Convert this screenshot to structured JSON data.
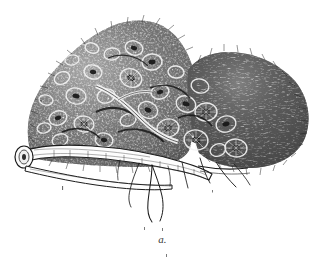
{
  "plate": {
    "kind": "engraving-illustration",
    "subject": "branch encrusted with a dense colony of barnacles",
    "caption": "a.",
    "background_color": "#ffffff",
    "ink_color": "#1e1e1e",
    "midtone_color": "#555555",
    "highlight_color": "#f4f4f4",
    "canvas": {
      "width": 325,
      "height": 271
    }
  },
  "regions": [
    {
      "name": "encrusting-colony-mass",
      "description": "large irregular dome of clustered shells and bristly growth occupying the upper two thirds of the plate",
      "bounds": {
        "x": 25,
        "y": 18,
        "width": 285,
        "height": 150
      },
      "tone": "dark stipple with light shell rings"
    },
    {
      "name": "left-lobe-shell-cluster",
      "description": "left peak of the colony, individual ringed barnacle shells clearly drawn",
      "bounds": {
        "x": 28,
        "y": 22,
        "width": 140,
        "height": 130
      },
      "tone": "mottled mid-grey"
    },
    {
      "name": "right-lobe-bristle-mass",
      "description": "rounded right lobe rendered as uniform dense bristly hatching",
      "bounds": {
        "x": 185,
        "y": 52,
        "width": 125,
        "height": 110
      },
      "tone": "dark uniform hatching"
    },
    {
      "name": "supporting-branch",
      "description": "pale woody stem running left to right beneath the colony, with a blunt cut end at the left",
      "bounds": {
        "x": 14,
        "y": 140,
        "width": 200,
        "height": 40
      },
      "tone": "white body with dark contour lines"
    },
    {
      "name": "lower-branch-fork",
      "description": "second thinner branch crossing below the main stem",
      "bounds": {
        "x": 30,
        "y": 160,
        "width": 160,
        "height": 26
      },
      "tone": "fine outline"
    },
    {
      "name": "trailing-rootlets",
      "description": "thin hair-like filaments hanging from the underside of the branch",
      "bounds": {
        "x": 130,
        "y": 160,
        "width": 115,
        "height": 62
      },
      "tone": "fine dark lines"
    },
    {
      "name": "cut-stem-end",
      "description": "blunt sawn-off end of the branch at far left showing an oval section",
      "bounds": {
        "x": 14,
        "y": 144,
        "width": 30,
        "height": 26
      },
      "tone": "light with dark rim"
    }
  ],
  "labels": [
    {
      "name": "figure-label",
      "text": "a.",
      "style": "italic",
      "position": "bottom-center"
    }
  ]
}
